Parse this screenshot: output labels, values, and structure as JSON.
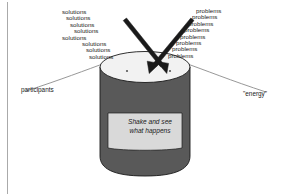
{
  "diagram": {
    "title": "Shake and see what happens",
    "colors": {
      "cylinder_body": "#595959",
      "cylinder_top": "#f2f2f2",
      "label_panel": "#d9d9d9",
      "outline": "#1a1a1a",
      "arrow": "#1a1a1a",
      "curve": "#808080",
      "margin_rule": "#aaaaaa",
      "text": "#1a1a1a"
    },
    "left_stack": {
      "word": "solutions",
      "lines": [
        "solutions",
        "solutions",
        "solutions",
        "solutions",
        "solutions",
        "solutions",
        "solutions",
        "solutions"
      ]
    },
    "right_stack": {
      "word": "problems",
      "lines": [
        "problems",
        "problems",
        "problems",
        "problems",
        "problems",
        "problems",
        "problems",
        "problems"
      ]
    },
    "labels": {
      "left": "participants",
      "right": "\"energy\""
    },
    "caption": {
      "line1": "Shake and see",
      "line2": "what happens"
    },
    "arrows": {
      "count": 2,
      "left_arrow_name": "solutions-arrow",
      "right_arrow_name": "problems-arrow"
    }
  }
}
